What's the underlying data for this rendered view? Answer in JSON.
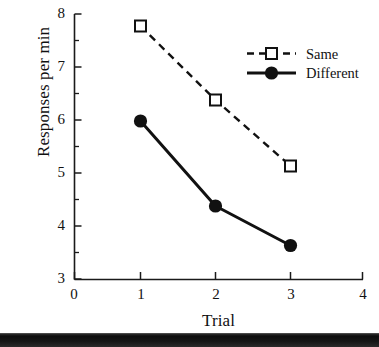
{
  "chart_data": {
    "type": "line",
    "title": "",
    "subtitle": "",
    "xlabel": "Trial",
    "ylabel": "Responses per min",
    "x": [
      1,
      2,
      3
    ],
    "categories": [
      "1",
      "2",
      "3"
    ],
    "series": [
      {
        "name": "Same",
        "values": [
          7.75,
          6.4,
          5.15
        ],
        "marker": "open-square",
        "linestyle": "dashed",
        "color": "#000000"
      },
      {
        "name": "Different",
        "values": [
          6.0,
          4.4,
          3.65
        ],
        "marker": "filled-circle",
        "linestyle": "solid",
        "color": "#000000"
      }
    ],
    "xlim": [
      0,
      4
    ],
    "ylim": [
      3,
      8
    ],
    "xticks": [
      "0",
      "1",
      "2",
      "3",
      "4"
    ],
    "yticks": [
      "3",
      "4",
      "5",
      "6",
      "7",
      "8"
    ],
    "y_minor_ticks": [
      3.5,
      4.5,
      5.5,
      6.5,
      7.5
    ],
    "grid": false,
    "legend_position": "upper right",
    "legend_entries": [
      "Same",
      "Different"
    ]
  },
  "axes": {
    "x_title": "Trial",
    "y_title": "Responses per min",
    "x_tick_labels": [
      "0",
      "1",
      "2",
      "3",
      "4"
    ],
    "y_tick_labels": [
      "3",
      "4",
      "5",
      "6",
      "7",
      "8"
    ]
  },
  "legend": {
    "items": [
      {
        "label": "Same"
      },
      {
        "label": "Different"
      }
    ]
  },
  "colors": {
    "ink": "#000000",
    "background": "#ffffff",
    "band": "#141414"
  }
}
